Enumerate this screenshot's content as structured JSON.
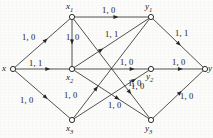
{
  "figure": {
    "type": "directed-graph",
    "colors": {
      "edge": "#262626",
      "node_stroke": "#1a1a1a",
      "node_fill": "#ffffff",
      "text": "#1a1a1a",
      "background": "#fcfcfa"
    },
    "nodes": [
      {
        "id": "x",
        "label": "x",
        "sub": "",
        "cx": 13,
        "cy": 69,
        "label_x": 2,
        "label_y": 64
      },
      {
        "id": "x1",
        "label": "x",
        "sub": "1",
        "cx": 72,
        "cy": 17,
        "label_x": 66,
        "label_y": 2
      },
      {
        "id": "x2",
        "label": "x",
        "sub": "2",
        "cx": 72,
        "cy": 69,
        "label_x": 66,
        "label_y": 73
      },
      {
        "id": "x3",
        "label": "x",
        "sub": "3",
        "cx": 72,
        "cy": 120,
        "label_x": 66,
        "label_y": 124
      },
      {
        "id": "y1",
        "label": "y",
        "sub": "1",
        "cx": 151,
        "cy": 17,
        "label_x": 145,
        "label_y": 2
      },
      {
        "id": "y2",
        "label": "y",
        "sub": "2",
        "cx": 151,
        "cy": 69,
        "label_x": 146,
        "label_y": 72
      },
      {
        "id": "y3",
        "label": "y",
        "sub": "3",
        "cx": 151,
        "cy": 120,
        "label_x": 145,
        "label_y": 124
      },
      {
        "id": "y",
        "label": "y",
        "sub": "",
        "cx": 205,
        "cy": 69,
        "label_x": 208,
        "label_y": 64
      }
    ],
    "edges": [
      {
        "from": "x",
        "to": "x1",
        "label": "1, 0",
        "label_x": 22,
        "label_y": 33,
        "arrow_t": 0.56
      },
      {
        "from": "x",
        "to": "x2",
        "label": "1, 1",
        "label_x": 29,
        "label_y": 59,
        "arrow_t": 0.6
      },
      {
        "from": "x",
        "to": "x3",
        "label": "1, 0",
        "label_x": 20,
        "label_y": 96,
        "arrow_t": 0.56
      },
      {
        "from": "x1",
        "to": "y1",
        "label": "1, 0",
        "label_x": 102,
        "label_y": 6,
        "arrow_t": 0.56
      },
      {
        "from": "x1",
        "to": "x2",
        "label": "1, 0",
        "label_x": 66,
        "label_y": 33,
        "arrow_t": 0.48
      },
      {
        "from": "x1",
        "to": "y3",
        "label": "1, 0",
        "label_x": 108,
        "label_y": 101,
        "arrow_t": 0.74
      },
      {
        "from": "x2",
        "to": "y1",
        "label": "1, 1",
        "label_x": 105,
        "label_y": 30,
        "arrow_t": 0.36
      },
      {
        "from": "x2",
        "to": "y2",
        "label": "1, 0",
        "label_x": 120,
        "label_y": 58,
        "arrow_t": 0.78
      },
      {
        "from": "x2",
        "to": "y3",
        "label": "1, 0",
        "label_x": 64,
        "label_y": 91,
        "arrow_t": 0.58
      },
      {
        "from": "x3",
        "to": "y1",
        "label": "1, 0",
        "label_x": 131,
        "label_y": 82,
        "arrow_t": 0.3
      },
      {
        "from": "x3",
        "to": "y2",
        "label": "1, 0",
        "label_x": 128,
        "label_y": 79,
        "arrow_t": 0.8
      },
      {
        "from": "y1",
        "to": "y",
        "label": "1, 1",
        "label_x": 175,
        "label_y": 29,
        "arrow_t": 0.52
      },
      {
        "from": "y2",
        "to": "y",
        "label": "1, 0",
        "label_x": 172,
        "label_y": 58,
        "arrow_t": 0.55
      },
      {
        "from": "y3",
        "to": "y",
        "label": "1, 0",
        "label_x": 180,
        "label_y": 92,
        "arrow_t": 0.54
      }
    ],
    "edge_label_values": [
      "1, 0",
      "1, 1"
    ]
  }
}
